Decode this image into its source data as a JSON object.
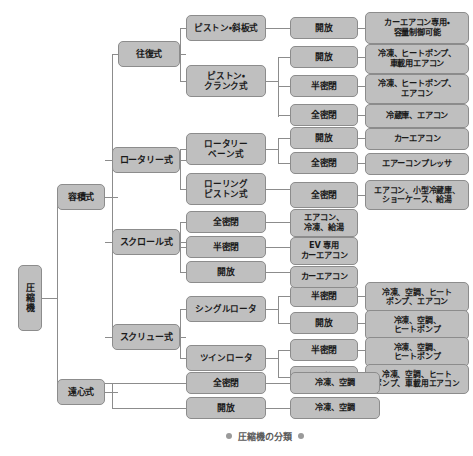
{
  "caption": {
    "text": "圧縮機の分類",
    "left_dot": "bullet-dot",
    "right_dot": "bullet-dot"
  },
  "colors": {
    "node_fill": "#bfbfbf",
    "node_border": "#8c8c8c",
    "connector": "#8c8c8c",
    "text": "#1a1a1a",
    "caption_text": "#5a5a5a",
    "background": "#ffffff"
  },
  "diagram": {
    "type": "tree",
    "orientation": "left-to-right",
    "levels": 5,
    "root": "圧縮機"
  },
  "nodes": {
    "root": {
      "label": "圧縮機",
      "x": 18,
      "y": 265,
      "w": 24,
      "h": 66,
      "fs": 9
    },
    "l2_positive": {
      "label": "容積式",
      "x": 57,
      "y": 184,
      "w": 48,
      "h": 26,
      "fs": 9
    },
    "l2_centrifugal": {
      "label": "遠心式",
      "x": 57,
      "y": 379,
      "w": 48,
      "h": 26,
      "fs": 9
    },
    "l3_recip": {
      "label": "往復式",
      "x": 118,
      "y": 41,
      "w": 62,
      "h": 26,
      "fs": 9
    },
    "l3_rotary": {
      "label": "ロータリー式",
      "x": 112,
      "y": 147,
      "w": 68,
      "h": 26,
      "fs": 9
    },
    "l3_scroll": {
      "label": "スクロール式",
      "x": 112,
      "y": 229,
      "w": 68,
      "h": 26,
      "fs": 9
    },
    "l3_screw": {
      "label": "スクリュー式",
      "x": 112,
      "y": 324,
      "w": 68,
      "h": 26,
      "fs": 9
    },
    "l4_piston_swash": {
      "label": "ピストン・斜板式",
      "x": 186,
      "y": 15,
      "w": 80,
      "h": 26,
      "fs": 8.6
    },
    "l4_piston_crank": {
      "label": "ピストン・\nクランク式",
      "x": 186,
      "y": 65,
      "w": 80,
      "h": 32,
      "fs": 8.6
    },
    "l4_rotary_vane": {
      "label": "ロータリー\nベーン式",
      "x": 186,
      "y": 133,
      "w": 80,
      "h": 32,
      "fs": 8.6
    },
    "l4_rolling_piston": {
      "label": "ローリング\nピストン式",
      "x": 186,
      "y": 173,
      "w": 80,
      "h": 32,
      "fs": 8.6
    },
    "l4_scroll_hermetic": {
      "label": "全密閉",
      "x": 186,
      "y": 211,
      "w": 80,
      "h": 22,
      "fs": 8.8
    },
    "l4_scroll_semi": {
      "label": "半密閉",
      "x": 186,
      "y": 236,
      "w": 80,
      "h": 22,
      "fs": 8.8
    },
    "l4_scroll_open": {
      "label": "開放",
      "x": 186,
      "y": 261,
      "w": 80,
      "h": 22,
      "fs": 8.8
    },
    "l4_single_rotor": {
      "label": "シングルロータ",
      "x": 186,
      "y": 296,
      "w": 80,
      "h": 26,
      "fs": 8.6
    },
    "l4_twin_rotor": {
      "label": "ツインロータ",
      "x": 186,
      "y": 345,
      "w": 80,
      "h": 26,
      "fs": 8.6
    },
    "l4_centri_hermetic": {
      "label": "全密閉",
      "x": 186,
      "y": 372,
      "w": 80,
      "h": 22,
      "fs": 8.8
    },
    "l4_centri_open": {
      "label": "開放",
      "x": 186,
      "y": 397,
      "w": 80,
      "h": 22,
      "fs": 8.8
    },
    "l5_sw_open": {
      "label": "開放",
      "x": 290,
      "y": 17,
      "w": 68,
      "h": 22,
      "fs": 8.8
    },
    "l5_cr_open": {
      "label": "開放",
      "x": 290,
      "y": 46,
      "w": 68,
      "h": 22,
      "fs": 8.8
    },
    "l5_cr_semi": {
      "label": "半密閉",
      "x": 290,
      "y": 75,
      "w": 68,
      "h": 22,
      "fs": 8.8
    },
    "l5_cr_hermetic": {
      "label": "全密閉",
      "x": 290,
      "y": 104,
      "w": 68,
      "h": 22,
      "fs": 8.8
    },
    "l5_vane_open": {
      "label": "開放",
      "x": 290,
      "y": 127,
      "w": 68,
      "h": 22,
      "fs": 8.8
    },
    "l5_vane_hermetic": {
      "label": "全密閉",
      "x": 290,
      "y": 152,
      "w": 68,
      "h": 22,
      "fs": 8.8
    },
    "l5_rolling_hermetic": {
      "label": "全密閉",
      "x": 290,
      "y": 182,
      "w": 68,
      "h": 26,
      "fs": 8.8
    },
    "l5_sr_semi": {
      "label": "半密閉",
      "x": 290,
      "y": 285,
      "w": 68,
      "h": 22,
      "fs": 8.8
    },
    "l5_sr_open": {
      "label": "開放",
      "x": 290,
      "y": 312,
      "w": 68,
      "h": 22,
      "fs": 8.8
    },
    "l5_tr_semi": {
      "label": "半密閉",
      "x": 290,
      "y": 339,
      "w": 68,
      "h": 22,
      "fs": 8.8
    },
    "l5_tr_open": {
      "label": "開放",
      "x": 290,
      "y": 366,
      "w": 68,
      "h": 22,
      "fs": 8.8
    },
    "app_sw_open": {
      "label": "カーエアコン専用・\n容量制御可能",
      "x": 365,
      "y": 12,
      "w": 104,
      "h": 32,
      "fs": 8.2
    },
    "app_cr_open": {
      "label": "冷凍、ヒートポンプ、\n車載用エアコン",
      "x": 365,
      "y": 44,
      "w": 104,
      "h": 30,
      "fs": 8.2
    },
    "app_cr_semi": {
      "label": "冷凍、ヒートポンプ、\nエアコン",
      "x": 365,
      "y": 74,
      "w": 104,
      "h": 30,
      "fs": 8.2
    },
    "app_cr_hermetic": {
      "label": "冷蔵庫、エアコン",
      "x": 365,
      "y": 104,
      "w": 104,
      "h": 24,
      "fs": 8.2
    },
    "app_vane_open": {
      "label": "カーエアコン",
      "x": 365,
      "y": 128,
      "w": 104,
      "h": 22,
      "fs": 8.2
    },
    "app_vane_hermetic": {
      "label": "エアーコンプレッサ",
      "x": 365,
      "y": 153,
      "w": 104,
      "h": 22,
      "fs": 8.2
    },
    "app_rolling": {
      "label": "エアコン、小型冷蔵庫、\nショーケース、給湯",
      "x": 365,
      "y": 180,
      "w": 104,
      "h": 30,
      "fs": 8.0
    },
    "app_scroll_hermetic": {
      "label": "エアコン、\n冷凍、給湯",
      "x": 290,
      "y": 209,
      "w": 68,
      "h": 28,
      "fs": 8.2
    },
    "app_scroll_semi": {
      "label": "EV 専用\nカーエアコン",
      "x": 290,
      "y": 237,
      "w": 68,
      "h": 28,
      "fs": 8.2
    },
    "app_scroll_open": {
      "label": "カーエアコン",
      "x": 290,
      "y": 266,
      "w": 68,
      "h": 22,
      "fs": 8.2
    },
    "app_sr_semi": {
      "label": "冷凍、空調、ヒート\nポンプ、エアコン",
      "x": 365,
      "y": 282,
      "w": 104,
      "h": 30,
      "fs": 8.0
    },
    "app_sr_open": {
      "label": "冷凍、空調、\nヒートポンプ",
      "x": 365,
      "y": 310,
      "w": 104,
      "h": 30,
      "fs": 8.0
    },
    "app_tr_semi": {
      "label": "冷凍、空調、\nヒートポンプ",
      "x": 365,
      "y": 337,
      "w": 104,
      "h": 30,
      "fs": 8.0
    },
    "app_tr_open": {
      "label": "冷凍、空調、ヒート\nポンプ、車載用エアコン",
      "x": 365,
      "y": 364,
      "w": 104,
      "h": 30,
      "fs": 7.8
    },
    "app_centri_hermetic": {
      "label": "冷凍、空調",
      "x": 290,
      "y": 372,
      "w": 90,
      "h": 22,
      "fs": 8.2
    },
    "app_centri_open": {
      "label": "冷凍、空調",
      "x": 290,
      "y": 397,
      "w": 90,
      "h": 22,
      "fs": 8.2
    }
  },
  "connectors": [
    {
      "o": "h",
      "x": 42,
      "y": 298,
      "len": 15
    },
    {
      "o": "v",
      "x": 57,
      "y": 197,
      "len": 195
    },
    {
      "o": "h",
      "x": 57,
      "y": 197,
      "len": 0
    },
    {
      "o": "h",
      "x": 105,
      "y": 197,
      "len": 13
    },
    {
      "o": "h",
      "x": 105,
      "y": 392,
      "len": 13
    },
    {
      "o": "v",
      "x": 112,
      "y": 54,
      "len": 283
    },
    {
      "o": "h",
      "x": 112,
      "y": 54,
      "len": 6
    },
    {
      "o": "h",
      "x": 105,
      "y": 160,
      "len": 7
    },
    {
      "o": "h",
      "x": 105,
      "y": 242,
      "len": 7
    },
    {
      "o": "h",
      "x": 105,
      "y": 337,
      "len": 7
    },
    {
      "o": "h",
      "x": 180,
      "y": 54,
      "len": 6
    },
    {
      "o": "v",
      "x": 180,
      "y": 28,
      "len": 53
    },
    {
      "o": "h",
      "x": 180,
      "y": 28,
      "len": 6
    },
    {
      "o": "h",
      "x": 180,
      "y": 81,
      "len": 6
    },
    {
      "o": "h",
      "x": 180,
      "y": 160,
      "len": 6
    },
    {
      "o": "v",
      "x": 180,
      "y": 149,
      "len": 40
    },
    {
      "o": "h",
      "x": 180,
      "y": 149,
      "len": 6
    },
    {
      "o": "h",
      "x": 180,
      "y": 189,
      "len": 6
    },
    {
      "o": "h",
      "x": 180,
      "y": 242,
      "len": 6
    },
    {
      "o": "v",
      "x": 180,
      "y": 222,
      "len": 50
    },
    {
      "o": "h",
      "x": 180,
      "y": 222,
      "len": 6
    },
    {
      "o": "h",
      "x": 180,
      "y": 247,
      "len": 6
    },
    {
      "o": "h",
      "x": 180,
      "y": 272,
      "len": 6
    },
    {
      "o": "h",
      "x": 180,
      "y": 337,
      "len": 6
    },
    {
      "o": "v",
      "x": 180,
      "y": 309,
      "len": 49
    },
    {
      "o": "h",
      "x": 180,
      "y": 309,
      "len": 6
    },
    {
      "o": "h",
      "x": 180,
      "y": 358,
      "len": 6
    },
    {
      "o": "h",
      "x": 105,
      "y": 383,
      "len": 7
    },
    {
      "o": "v",
      "x": 112,
      "y": 383,
      "len": 25
    },
    {
      "o": "h",
      "x": 112,
      "y": 383,
      "len": 74
    },
    {
      "o": "h",
      "x": 112,
      "y": 408,
      "len": 74
    },
    {
      "o": "h",
      "x": 266,
      "y": 28,
      "len": 24
    },
    {
      "o": "h",
      "x": 266,
      "y": 81,
      "len": 12
    },
    {
      "o": "v",
      "x": 278,
      "y": 57,
      "len": 60
    },
    {
      "o": "h",
      "x": 278,
      "y": 57,
      "len": 12
    },
    {
      "o": "h",
      "x": 278,
      "y": 86,
      "len": 12
    },
    {
      "o": "h",
      "x": 278,
      "y": 115,
      "len": 12
    },
    {
      "o": "h",
      "x": 266,
      "y": 149,
      "len": 12
    },
    {
      "o": "v",
      "x": 278,
      "y": 138,
      "len": 25
    },
    {
      "o": "h",
      "x": 278,
      "y": 138,
      "len": 12
    },
    {
      "o": "h",
      "x": 278,
      "y": 163,
      "len": 12
    },
    {
      "o": "h",
      "x": 266,
      "y": 189,
      "len": 24
    },
    {
      "o": "h",
      "x": 266,
      "y": 222,
      "len": 24
    },
    {
      "o": "h",
      "x": 266,
      "y": 247,
      "len": 24
    },
    {
      "o": "h",
      "x": 266,
      "y": 272,
      "len": 24
    },
    {
      "o": "h",
      "x": 266,
      "y": 309,
      "len": 12
    },
    {
      "o": "v",
      "x": 278,
      "y": 296,
      "len": 27
    },
    {
      "o": "h",
      "x": 278,
      "y": 296,
      "len": 12
    },
    {
      "o": "h",
      "x": 278,
      "y": 323,
      "len": 12
    },
    {
      "o": "h",
      "x": 266,
      "y": 358,
      "len": 12
    },
    {
      "o": "v",
      "x": 278,
      "y": 350,
      "len": 27
    },
    {
      "o": "h",
      "x": 278,
      "y": 350,
      "len": 12
    },
    {
      "o": "h",
      "x": 278,
      "y": 377,
      "len": 12
    },
    {
      "o": "h",
      "x": 266,
      "y": 383,
      "len": 24
    },
    {
      "o": "h",
      "x": 266,
      "y": 408,
      "len": 24
    },
    {
      "o": "h",
      "x": 358,
      "y": 28,
      "len": 7
    },
    {
      "o": "h",
      "x": 358,
      "y": 57,
      "len": 7
    },
    {
      "o": "h",
      "x": 358,
      "y": 86,
      "len": 7
    },
    {
      "o": "h",
      "x": 358,
      "y": 115,
      "len": 7
    },
    {
      "o": "h",
      "x": 358,
      "y": 138,
      "len": 7
    },
    {
      "o": "h",
      "x": 358,
      "y": 163,
      "len": 7
    },
    {
      "o": "h",
      "x": 358,
      "y": 195,
      "len": 7
    },
    {
      "o": "h",
      "x": 358,
      "y": 296,
      "len": 7
    },
    {
      "o": "h",
      "x": 358,
      "y": 323,
      "len": 7
    },
    {
      "o": "h",
      "x": 358,
      "y": 350,
      "len": 7
    },
    {
      "o": "h",
      "x": 358,
      "y": 377,
      "len": 7
    }
  ],
  "caption_box": {
    "x": 185,
    "y": 428,
    "w": 160,
    "h": 16,
    "fs": 9
  }
}
